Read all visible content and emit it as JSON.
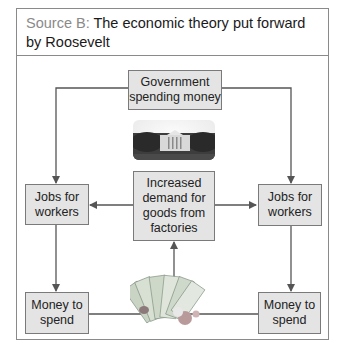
{
  "header": {
    "source_label": "Source B:",
    "title": "The economic theory put forward by Roosevelt"
  },
  "diagram": {
    "nodes": {
      "government": "Government spending money",
      "jobs_left": "Jobs for workers",
      "jobs_right": "Jobs for workers",
      "demand": "Increased demand for goods from factories",
      "money_left": "Money to spend",
      "money_right": "Money to spend"
    },
    "images": {
      "white_house": "white-house-photo",
      "banknotes": "banknotes-and-coins-photo"
    },
    "edges": [
      {
        "from": "government",
        "to": "jobs_left"
      },
      {
        "from": "government",
        "to": "jobs_right"
      },
      {
        "from": "demand",
        "to": "jobs_left"
      },
      {
        "from": "demand",
        "to": "jobs_right"
      },
      {
        "from": "jobs_left",
        "to": "money_left"
      },
      {
        "from": "jobs_right",
        "to": "money_right"
      },
      {
        "from": "money_left",
        "to": "demand"
      },
      {
        "from": "money_right",
        "to": "demand"
      }
    ],
    "colors": {
      "box_fill": "#e4e4e4",
      "line": "#555555",
      "source_label": "#8a8a8a"
    }
  }
}
